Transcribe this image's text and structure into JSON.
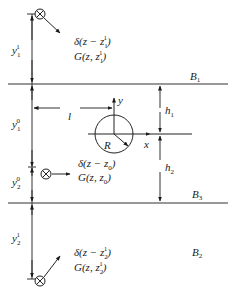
{
  "diagram": {
    "boundaries": [
      {
        "id": "B1",
        "label": "B",
        "sub": "1",
        "y": 84
      },
      {
        "id": "B3",
        "label": "B",
        "sub": "3",
        "y": 203
      },
      {
        "id": "B2",
        "label": "B",
        "sub": "2"
      }
    ],
    "dimensions": {
      "y1_1": {
        "base": "y",
        "sup": "1",
        "sub": "1"
      },
      "y1_0": {
        "base": "y",
        "sup": "0",
        "sub": "1"
      },
      "y2_0": {
        "base": "y",
        "sup": "0",
        "sub": "2"
      },
      "y2_1": {
        "base": "y",
        "sup": "1",
        "sub": "2"
      },
      "h1": {
        "base": "h",
        "sub": "1"
      },
      "h2": {
        "base": "h",
        "sub": "2"
      },
      "l": "l"
    },
    "axes": {
      "x": "x",
      "y": "y"
    },
    "circle": {
      "radius_label": "R"
    },
    "sources": [
      {
        "id": "top-image-source",
        "delta": {
          "pre": "δ(z − z",
          "sub": "1",
          "sup": "1",
          "post": ")"
        },
        "green": {
          "pre": "G(z, z",
          "sub": "1",
          "sup": "1",
          "post": ")"
        }
      },
      {
        "id": "real-source",
        "delta": {
          "pre": "δ(z − z",
          "sub": "0",
          "post": ")"
        },
        "green": {
          "pre": "G(z, z",
          "sub": "0",
          "post": ")"
        }
      },
      {
        "id": "bottom-image-source",
        "delta": {
          "pre": "δ(z − z",
          "sub": "2",
          "sup": "1",
          "post": ")"
        },
        "green": {
          "pre": "G(z, z",
          "sub": "2",
          "sup": "1",
          "post": ")"
        }
      }
    ]
  }
}
